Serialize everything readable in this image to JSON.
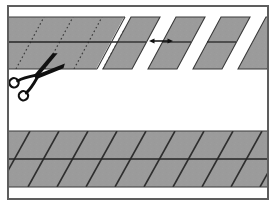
{
  "figure": {
    "title": "Cutting a striped band diagonally into parallelogram segments",
    "canvas": {
      "width": 275,
      "height": 206
    },
    "background_color": "#ffffff"
  },
  "frame": {
    "name": "outer-border",
    "x": 8,
    "y": 6,
    "width": 260,
    "height": 193,
    "stroke_color": "#5d5d5d",
    "stroke_width": 2,
    "fill_color": "#ffffff"
  },
  "style": {
    "band_fill": "#9b9b9b",
    "band_fill_alt": "#949494",
    "band_edge_color": "#3a3a3a",
    "band_edge_width": 1.1,
    "diagonal_line_color": "#2e2e2e",
    "diagonal_line_width": 1.6,
    "midline_color": "#262626",
    "midline_width": 1.3,
    "dotted_line_color": "#3c3c3c",
    "dotted_line_width": 1.2,
    "dotted_dash_pattern": "1.6 2.6",
    "scissors_color": "#101010",
    "arrow_color": "#111111",
    "texture_opacity": 0.1
  },
  "geometry": {
    "slant_dx_per_band": 28,
    "slant_note": "Diagonals lean to the right going up; horizontal run of 28px over the 52px band height."
  },
  "top_band": {
    "name": "band-being-cut",
    "label": "Band marked with diagonal cut lines",
    "x": 9,
    "y": 17,
    "width": 115,
    "height": 52,
    "midline_y": 42,
    "cut_lines": [
      {
        "id": "cut-1",
        "x_bottom": 16,
        "style": "dotted"
      },
      {
        "id": "cut-2",
        "x_bottom": 45,
        "style": "dotted"
      },
      {
        "id": "cut-3",
        "x_bottom": 74,
        "style": "dotted"
      },
      {
        "id": "cut-4",
        "x_bottom": 103,
        "style": "dotted"
      }
    ]
  },
  "cut_strips": {
    "name": "separated-parallelogram-strips",
    "label": "Cut pieces pulled apart",
    "band_top_y": 17,
    "band_bottom_y": 69,
    "midline_y": 42,
    "strip_width": 29,
    "strips": [
      {
        "id": "strip-1",
        "x_bottom": 103,
        "clipped": false
      },
      {
        "id": "strip-2",
        "x_bottom": 148,
        "clipped": false
      },
      {
        "id": "strip-3",
        "x_bottom": 193,
        "clipped": false
      },
      {
        "id": "strip-4",
        "x_bottom": 238,
        "clipped": true
      }
    ]
  },
  "gap_arrow": {
    "name": "gap-dimension-arrow",
    "label": "Spacing between cut strips",
    "x_start": 150,
    "x_end": 172,
    "y": 41,
    "double_headed": true,
    "head_size": 4.2
  },
  "scissors": {
    "name": "scissors",
    "label": "Scissors cutting along the dotted line",
    "pivot_x": 37,
    "pivot_y": 76,
    "rotation_deg": -36,
    "scale": 1.0,
    "handle_radius": 4.6
  },
  "bottom_band": {
    "name": "uncut-continuous-band",
    "label": "Continuous band with diagonal stripes",
    "x": 9,
    "y": 131,
    "width": 258,
    "height": 56,
    "midline_y": 159,
    "stripe_spacing": 29,
    "stripe_count": 12
  }
}
